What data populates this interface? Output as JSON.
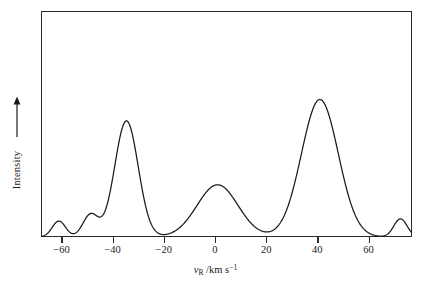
{
  "chart_data": {
    "type": "line",
    "title": "",
    "subtitle": "",
    "xlabel_plain": "v_R / km s^-1",
    "xlabel_parts": {
      "symbol": "v",
      "subscript": "R",
      "separator": " /km s",
      "superscript": "−1"
    },
    "ylabel": "Intensity",
    "ylabel_arrow": "up-arrow",
    "xlim": [
      -68,
      77
    ],
    "ylim": [
      0,
      1.06
    ],
    "xticks": [
      -60,
      -40,
      -20,
      0,
      20,
      40,
      60
    ],
    "xticklabels": [
      "−60",
      "−40",
      "−20",
      "0",
      "20",
      "40",
      "60"
    ],
    "yticks": [],
    "yticklabels": [],
    "grid": false,
    "legend": false,
    "legend_position": "none",
    "line_color": "#1a1a1a",
    "line_width": 1.3,
    "frame_color": "#2a2a2a",
    "background": "#ffffff",
    "components": [
      {
        "name": "component-1",
        "center": -61.0,
        "amplitude": 0.075,
        "width": 2.6
      },
      {
        "name": "component-2",
        "center": -48.6,
        "amplitude": 0.105,
        "width": 3.0
      },
      {
        "name": "component-3",
        "center": -34.6,
        "amplitude": 0.545,
        "width": 4.6
      },
      {
        "name": "component-4",
        "center": 1.0,
        "amplitude": 0.245,
        "width": 8.0
      },
      {
        "name": "component-5",
        "center": 41.0,
        "amplitude": 0.645,
        "width": 7.2
      },
      {
        "name": "component-6",
        "center": 72.5,
        "amplitude": 0.085,
        "width": 2.6
      }
    ],
    "peaks": [
      {
        "x": -61.0,
        "y": 0.08
      },
      {
        "x": -48.6,
        "y": 0.11
      },
      {
        "x": -34.6,
        "y": 0.55
      },
      {
        "x": 1.0,
        "y": 0.25
      },
      {
        "x": 41.0,
        "y": 0.65
      },
      {
        "x": 72.5,
        "y": 0.09
      }
    ],
    "baseline": 0.0,
    "x": [
      -68,
      -66,
      -64,
      -62,
      -61,
      -60,
      -58,
      -56,
      -54,
      -52,
      -50,
      -48.6,
      -47,
      -45,
      -43,
      -41,
      -39,
      -37,
      -35.5,
      -34.6,
      -33.5,
      -32,
      -30,
      -28,
      -26,
      -24,
      -22,
      -20,
      -18,
      -16,
      -14,
      -12,
      -10,
      -8,
      -6,
      -4,
      -2,
      0,
      1,
      3,
      5,
      7,
      9,
      11,
      13,
      15,
      17,
      19,
      21,
      23,
      25,
      27,
      29,
      31,
      33,
      35,
      37,
      39,
      41,
      43,
      45,
      47,
      49,
      51,
      53,
      55,
      57,
      59,
      61,
      63,
      65,
      67,
      69,
      71,
      72.5,
      74,
      76,
      77
    ],
    "y": [
      0.003,
      0.005,
      0.017,
      0.065,
      0.076,
      0.066,
      0.021,
      0.01,
      0.016,
      0.045,
      0.094,
      0.107,
      0.09,
      0.051,
      0.036,
      0.06,
      0.18,
      0.41,
      0.535,
      0.548,
      0.53,
      0.455,
      0.325,
      0.215,
      0.145,
      0.1,
      0.072,
      0.055,
      0.048,
      0.05,
      0.062,
      0.088,
      0.126,
      0.17,
      0.21,
      0.236,
      0.247,
      0.249,
      0.249,
      0.24,
      0.222,
      0.196,
      0.165,
      0.132,
      0.102,
      0.077,
      0.058,
      0.046,
      0.042,
      0.046,
      0.06,
      0.09,
      0.145,
      0.235,
      0.35,
      0.47,
      0.57,
      0.63,
      0.648,
      0.632,
      0.58,
      0.498,
      0.398,
      0.298,
      0.21,
      0.142,
      0.094,
      0.062,
      0.042,
      0.032,
      0.03,
      0.038,
      0.056,
      0.08,
      0.088,
      0.072,
      0.025,
      0.006
    ]
  },
  "axis": {
    "x_tick_labels": [
      "−60",
      "−40",
      "−20",
      "0",
      "20",
      "40",
      "60"
    ],
    "x_tick_values": [
      -60,
      -40,
      -20,
      0,
      20,
      40,
      60
    ],
    "y_axis_label": "Intensity"
  }
}
